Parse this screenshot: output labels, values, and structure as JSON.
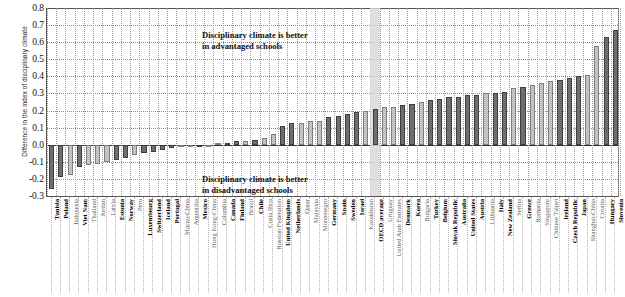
{
  "chart_data": {
    "type": "bar",
    "title": "",
    "xlabel": "",
    "ylabel": "Difference in the index of disciplinary climate",
    "ylim": [
      -0.3,
      0.8
    ],
    "ytick_labels": [
      "0.8",
      "0.7",
      "0.6",
      "0.5",
      "0.4",
      "0.3",
      "0.2",
      "0.1",
      "0.0",
      "-0.1",
      "-0.2",
      "-0.3"
    ],
    "ytick_values": [
      0.8,
      0.7,
      0.6,
      0.5,
      0.4,
      0.3,
      0.2,
      0.1,
      0.0,
      -0.1,
      -0.2,
      -0.3
    ],
    "grid": true,
    "legend_position": "none",
    "annotations": [
      "Disciplinary climate is better\nin advantaged schools",
      "Disciplinary climate is better\nin disadvantaged schools"
    ],
    "highlight_category": "OECD average",
    "categories": [
      "Tunisia",
      "Poland",
      "Indonesia",
      "Viet Nam",
      "Thailand",
      "Jordan",
      "Latvia",
      "Estonia",
      "Norway",
      "Peru",
      "Luxembourg",
      "Switzerland",
      "Iceland",
      "Portugal",
      "Macao-China",
      "Argentina",
      "Mexico",
      "Hong Kong-China",
      "Colombia",
      "Canada",
      "Finland",
      "Brazil",
      "Chile",
      "Costa Rica",
      "Russian Federation",
      "United Kingdom",
      "Netherlands",
      "Qatar",
      "Malaysia",
      "Montenegro",
      "Germany",
      "Spain",
      "Sweden",
      "Israel",
      "Kazakhstan",
      "OECD average",
      "Uruguay",
      "United Arab Emirates",
      "Denmark",
      "Korea",
      "Bulgaria",
      "Turkey",
      "Belgium",
      "Slovak Republic",
      "Australia",
      "United States",
      "Austria",
      "Lithuania",
      "Italy",
      "New Zealand",
      "Serbia",
      "Greece",
      "Romania",
      "Singapore",
      "Chinese Taipei",
      "Ireland",
      "Czech Republic",
      "Japan",
      "Shanghai-China",
      "Croatia",
      "Hungary",
      "Slovenia"
    ],
    "values": [
      -0.26,
      -0.19,
      -0.18,
      -0.13,
      -0.12,
      -0.11,
      -0.1,
      -0.09,
      -0.08,
      -0.06,
      -0.05,
      -0.04,
      -0.03,
      -0.02,
      -0.01,
      -0.01,
      0.0,
      0.0,
      0.01,
      0.01,
      0.02,
      0.02,
      0.03,
      0.04,
      0.06,
      0.11,
      0.13,
      0.13,
      0.14,
      0.14,
      0.16,
      0.17,
      0.18,
      0.19,
      0.2,
      0.21,
      0.22,
      0.22,
      0.23,
      0.24,
      0.25,
      0.26,
      0.27,
      0.28,
      0.28,
      0.29,
      0.29,
      0.3,
      0.3,
      0.31,
      0.33,
      0.34,
      0.35,
      0.36,
      0.37,
      0.38,
      0.39,
      0.4,
      0.41,
      0.58,
      0.63,
      0.67
    ],
    "significance": [
      true,
      true,
      false,
      true,
      false,
      false,
      false,
      true,
      true,
      false,
      true,
      true,
      true,
      true,
      false,
      false,
      true,
      false,
      false,
      true,
      true,
      false,
      true,
      false,
      false,
      true,
      true,
      false,
      false,
      false,
      true,
      true,
      true,
      true,
      false,
      true,
      false,
      false,
      true,
      true,
      false,
      true,
      true,
      true,
      true,
      true,
      true,
      false,
      true,
      true,
      false,
      true,
      false,
      false,
      false,
      true,
      true,
      true,
      false,
      false,
      true,
      true
    ],
    "series_note": {
      "significant": "dark bar (statistically significant difference)",
      "not_significant": "light bar (difference not statistically significant)"
    }
  }
}
